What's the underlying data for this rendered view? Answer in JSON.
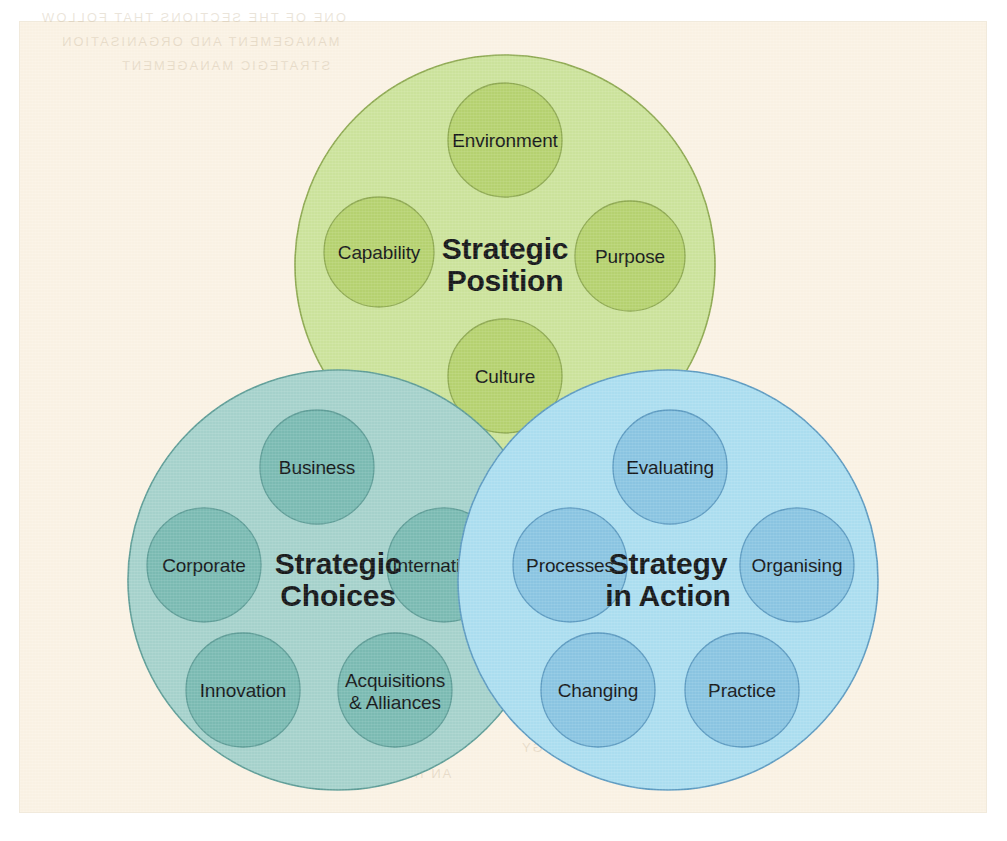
{
  "figure": {
    "background_page_color": "#fbf3e5",
    "frame_color": "#ffffff"
  },
  "chart_data": {
    "type": "venn",
    "layout": "three overlapping circles: one top-centre, two on the bottom row",
    "legend_position": "none",
    "grid": false,
    "circles": [
      {
        "id": "strategic-position",
        "title": "Strategic\nPosition",
        "title_line1": "Strategic",
        "title_line2": "Position",
        "fill": "#cde49d",
        "inner_fill": "#b7d371",
        "stroke": "#8faa52",
        "cx": 505,
        "cy": 265,
        "r": 210,
        "z": 1,
        "nodes": [
          {
            "label": "Environment",
            "cx": 505,
            "cy": 140,
            "r": 57,
            "position": "top"
          },
          {
            "label": "Purpose",
            "cx": 630,
            "cy": 256,
            "r": 55,
            "position": "right"
          },
          {
            "label": "Culture",
            "cx": 505,
            "cy": 376,
            "r": 57,
            "position": "bottom"
          },
          {
            "label": "Capability",
            "cx": 379,
            "cy": 252,
            "r": 55,
            "position": "left"
          }
        ]
      },
      {
        "id": "strategic-choices",
        "title": "Strategic\nChoices",
        "title_line1": "Strategic",
        "title_line2": "Choices",
        "fill": "#a7d3cd",
        "inner_fill": "#7cbcb4",
        "stroke": "#5f9e98",
        "cx": 338,
        "cy": 580,
        "r": 210,
        "z": 2,
        "nodes": [
          {
            "label": "Business",
            "cx": 317,
            "cy": 467,
            "r": 57,
            "position": "top"
          },
          {
            "label": "International",
            "cx": 444,
            "cy": 565,
            "r": 57,
            "position": "right"
          },
          {
            "label": "Acquisitions\n& Alliances",
            "label_line1": "Acquisitions",
            "label_line2": "& Alliances",
            "cx": 395,
            "cy": 690,
            "r": 57,
            "position": "bottom-right"
          },
          {
            "label": "Innovation",
            "cx": 243,
            "cy": 690,
            "r": 57,
            "position": "bottom-left"
          },
          {
            "label": "Corporate",
            "cx": 204,
            "cy": 565,
            "r": 57,
            "position": "left"
          }
        ]
      },
      {
        "id": "strategy-in-action",
        "title": "Strategy\nin Action",
        "title_line1": "Strategy",
        "title_line2": "in Action",
        "fill": "#addff1",
        "inner_fill": "#8bc6e3",
        "stroke": "#5e9cc2",
        "cx": 668,
        "cy": 580,
        "r": 210,
        "z": 3,
        "nodes": [
          {
            "label": "Evaluating",
            "cx": 670,
            "cy": 467,
            "r": 57,
            "position": "top"
          },
          {
            "label": "Organising",
            "cx": 797,
            "cy": 565,
            "r": 57,
            "position": "right"
          },
          {
            "label": "Practice",
            "cx": 742,
            "cy": 690,
            "r": 57,
            "position": "bottom-right"
          },
          {
            "label": "Changing",
            "cx": 598,
            "cy": 690,
            "r": 57,
            "position": "bottom-left"
          },
          {
            "label": "Processes",
            "cx": 570,
            "cy": 565,
            "r": 57,
            "position": "left"
          }
        ]
      }
    ]
  },
  "ghost_text": [
    {
      "text": "ONE OF THE SECTIONS THAT FOLLOW",
      "x": 40,
      "y": 10
    },
    {
      "text": "MANAGEMENT AND ORGANISATION",
      "x": 60,
      "y": 34
    },
    {
      "text": "STRATEGIC MANAGEMENT",
      "x": 120,
      "y": 58
    },
    {
      "text": "DEVELOPING STRATEGY",
      "x": 520,
      "y": 740
    },
    {
      "text": "AN INTRODUCTION",
      "x": 300,
      "y": 766
    }
  ]
}
